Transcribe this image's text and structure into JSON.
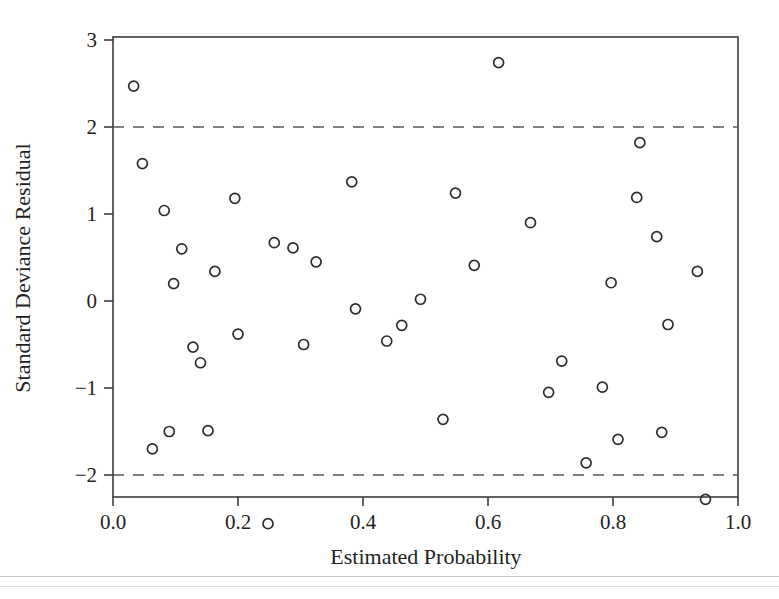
{
  "figure": {
    "kind": "scatter-residual-plot",
    "background": "#ffffff",
    "marker_color": "#2f2b2c",
    "axis_color": "#3c3c40",
    "reference_line_color": "#55555c"
  },
  "axes": {
    "x_title": "Estimated Probability",
    "y_title": "Standard Deviance Residual",
    "x_tick_labels": [
      "0.0",
      "0.2",
      "0.4",
      "0.6",
      "0.8",
      "1.0"
    ],
    "y_tick_labels": [
      "3",
      "2",
      "1",
      "0",
      "−1",
      "−2"
    ]
  },
  "chart_data": {
    "type": "scatter",
    "title": "",
    "xlabel": "Estimated Probability",
    "ylabel": "Standard Deviance Residual",
    "xlim": [
      0.0,
      1.0
    ],
    "ylim": [
      -2.5,
      3.0
    ],
    "xticks": [
      0.0,
      0.2,
      0.4,
      0.6,
      0.8,
      1.0
    ],
    "yticks": [
      -2,
      -1,
      0,
      1,
      2,
      3
    ],
    "grid": false,
    "legend": "none",
    "reference_lines": [
      {
        "axis": "y",
        "value": 2,
        "style": "dashed"
      },
      {
        "axis": "y",
        "value": -2,
        "style": "dashed"
      }
    ],
    "marker": {
      "shape": "circle",
      "filled": false,
      "radius_px": 5
    },
    "points": [
      {
        "x": 0.033,
        "y": 2.47
      },
      {
        "x": 0.047,
        "y": 1.58
      },
      {
        "x": 0.063,
        "y": -1.7
      },
      {
        "x": 0.082,
        "y": 1.04
      },
      {
        "x": 0.09,
        "y": -1.5
      },
      {
        "x": 0.097,
        "y": 0.2
      },
      {
        "x": 0.11,
        "y": 0.6
      },
      {
        "x": 0.128,
        "y": -0.53
      },
      {
        "x": 0.14,
        "y": -0.71
      },
      {
        "x": 0.152,
        "y": -1.49
      },
      {
        "x": 0.163,
        "y": 0.34
      },
      {
        "x": 0.195,
        "y": 1.18
      },
      {
        "x": 0.2,
        "y": -0.38
      },
      {
        "x": 0.248,
        "y": -2.56
      },
      {
        "x": 0.258,
        "y": 0.67
      },
      {
        "x": 0.288,
        "y": 0.61
      },
      {
        "x": 0.305,
        "y": -0.5
      },
      {
        "x": 0.325,
        "y": 0.45
      },
      {
        "x": 0.382,
        "y": 1.37
      },
      {
        "x": 0.388,
        "y": -0.09
      },
      {
        "x": 0.438,
        "y": -0.46
      },
      {
        "x": 0.462,
        "y": -0.28
      },
      {
        "x": 0.492,
        "y": 0.02
      },
      {
        "x": 0.528,
        "y": -1.36
      },
      {
        "x": 0.548,
        "y": 1.24
      },
      {
        "x": 0.578,
        "y": 0.41
      },
      {
        "x": 0.617,
        "y": 2.74
      },
      {
        "x": 0.668,
        "y": 0.9
      },
      {
        "x": 0.697,
        "y": -1.05
      },
      {
        "x": 0.718,
        "y": -0.69
      },
      {
        "x": 0.757,
        "y": -1.86
      },
      {
        "x": 0.783,
        "y": -0.99
      },
      {
        "x": 0.797,
        "y": 0.21
      },
      {
        "x": 0.808,
        "y": -1.59
      },
      {
        "x": 0.838,
        "y": 1.19
      },
      {
        "x": 0.843,
        "y": 1.82
      },
      {
        "x": 0.87,
        "y": 0.74
      },
      {
        "x": 0.878,
        "y": -1.51
      },
      {
        "x": 0.888,
        "y": -0.27
      },
      {
        "x": 0.935,
        "y": 0.34
      },
      {
        "x": 0.948,
        "y": -2.28
      }
    ]
  }
}
